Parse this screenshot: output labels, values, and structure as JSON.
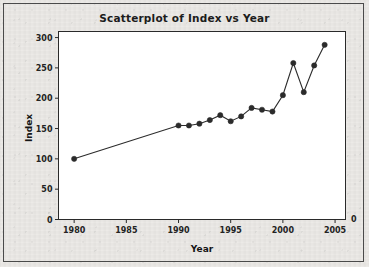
{
  "chart_data": {
    "type": "line",
    "title": "Scatterplot of Index vs Year",
    "xlabel": "Year",
    "ylabel": "Index",
    "xlim": [
      1978.5,
      2006.0
    ],
    "ylim": [
      0,
      310
    ],
    "xticks": [
      1980,
      1985,
      1990,
      1995,
      2000,
      2005
    ],
    "yticks": [
      0,
      50,
      100,
      150,
      200,
      250,
      300
    ],
    "grid": false,
    "legend": null,
    "marker": "filled-circle",
    "marker_color": "#2b2b2b",
    "line_color": "#2b2b2b",
    "baseline_zero_label": "0",
    "x": [
      1980,
      1990,
      1991,
      1992,
      1993,
      1994,
      1995,
      1996,
      1997,
      1998,
      1999,
      2000,
      2001,
      2002,
      2003,
      2004
    ],
    "values": [
      100,
      155,
      155,
      158,
      164,
      172,
      162,
      170,
      184,
      181,
      178,
      205,
      258,
      210,
      254,
      288
    ],
    "points": [
      {
        "year": 1980,
        "index": 100
      },
      {
        "year": 1990,
        "index": 155
      },
      {
        "year": 1991,
        "index": 155
      },
      {
        "year": 1992,
        "index": 158
      },
      {
        "year": 1993,
        "index": 164
      },
      {
        "year": 1994,
        "index": 172
      },
      {
        "year": 1995,
        "index": 162
      },
      {
        "year": 1996,
        "index": 170
      },
      {
        "year": 1997,
        "index": 184
      },
      {
        "year": 1998,
        "index": 181
      },
      {
        "year": 1999,
        "index": 178
      },
      {
        "year": 2000,
        "index": 205
      },
      {
        "year": 2001,
        "index": 258
      },
      {
        "year": 2002,
        "index": 210
      },
      {
        "year": 2003,
        "index": 254
      },
      {
        "year": 2004,
        "index": 288
      }
    ]
  },
  "figure": {
    "title": "Scatterplot of Index vs Year",
    "x_axis_title": "Year",
    "y_axis_title": "Index",
    "x_tick_labels": [
      "1980",
      "1985",
      "1990",
      "1995",
      "2000",
      "2005"
    ],
    "y_tick_labels": [
      "0",
      "50",
      "100",
      "150",
      "200",
      "250",
      "300"
    ],
    "right_zero_label": "0"
  }
}
